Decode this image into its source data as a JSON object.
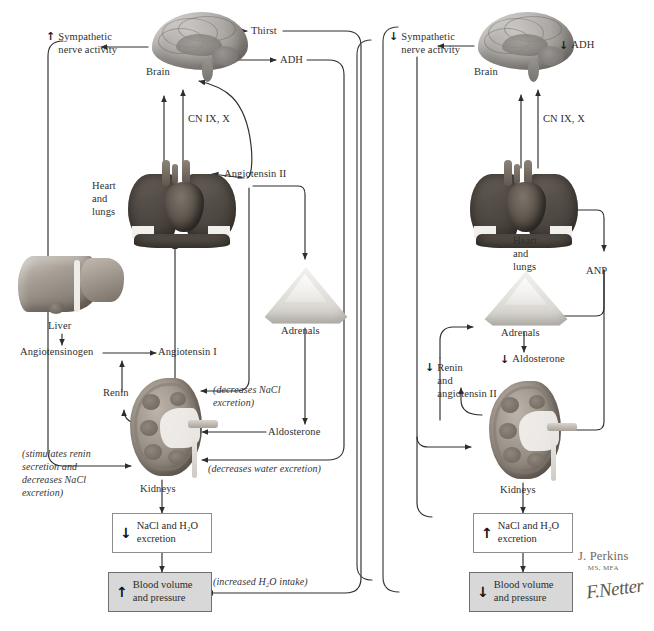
{
  "figure": {
    "panels": [
      "left",
      "right"
    ]
  },
  "left_panel": {
    "name": "volume-contraction",
    "labels": {
      "sympathetic": "Sympathetic\nnerve activity",
      "sympathetic_arrow": "↑",
      "brain": "Brain",
      "thirst": "Thirst",
      "adh": "ADH",
      "cn": "CN IX, X",
      "heart_lungs": "Heart\nand\nlungs",
      "angiotensin2": "Angiotensin II",
      "liver": "Liver",
      "angiotensinogen": "Angiotensinogen",
      "angiotensin1": "Angiotensin I",
      "renin": "Renin",
      "adrenals": "Adrenals",
      "aldosterone": "Aldosterone",
      "kidneys": "Kidneys",
      "note_nacl": "(decreases NaCl\nexcretion)",
      "note_renin": "(stimulates renin\nsecretion and\ndecreases NaCl\nexcretion)",
      "note_water": "(decreases water excretion)",
      "note_intake": "(increased H₂O intake)"
    },
    "boxes": [
      {
        "name": "nacl-excretion-box",
        "arrow": "↓",
        "text": "NaCl and H₂O\nexcretion",
        "shaded": false
      },
      {
        "name": "blood-volume-box",
        "arrow": "↑",
        "text": "Blood volume\nand pressure",
        "shaded": true
      }
    ]
  },
  "right_panel": {
    "name": "volume-expansion",
    "labels": {
      "sympathetic": "Sympathetic\nnerve activity",
      "sympathetic_arrow": "↓",
      "brain": "Brain",
      "adh": "ADH",
      "adh_arrow": "↓",
      "cn": "CN IX, X",
      "heart_lungs": "Heart\nand\nlungs",
      "anp": "ANP",
      "adrenals": "Adrenals",
      "aldosterone": "Aldosterone",
      "aldosterone_arrow": "↓",
      "renin": "Renin\nand\nangiotensin II",
      "renin_arrow": "↓",
      "kidneys": "Kidneys"
    },
    "boxes": [
      {
        "name": "nacl-excretion-box",
        "arrow": "↑",
        "text": "NaCl and H₂O\nexcretion",
        "shaded": false
      },
      {
        "name": "blood-volume-box",
        "arrow": "↓",
        "text": "Blood volume\nand pressure",
        "shaded": true
      }
    ]
  },
  "credits": {
    "artist_name": "J. Perkins",
    "artist_degrees": "MS, MFA",
    "netter_signature": "Netter",
    "netter_initials": "F."
  },
  "colors": {
    "line": "#2d2d2d",
    "text": "#2f2f2f",
    "box_border": "#8d8d8d",
    "box_shaded_fill": "#d8d8d8",
    "background": "#ffffff"
  }
}
